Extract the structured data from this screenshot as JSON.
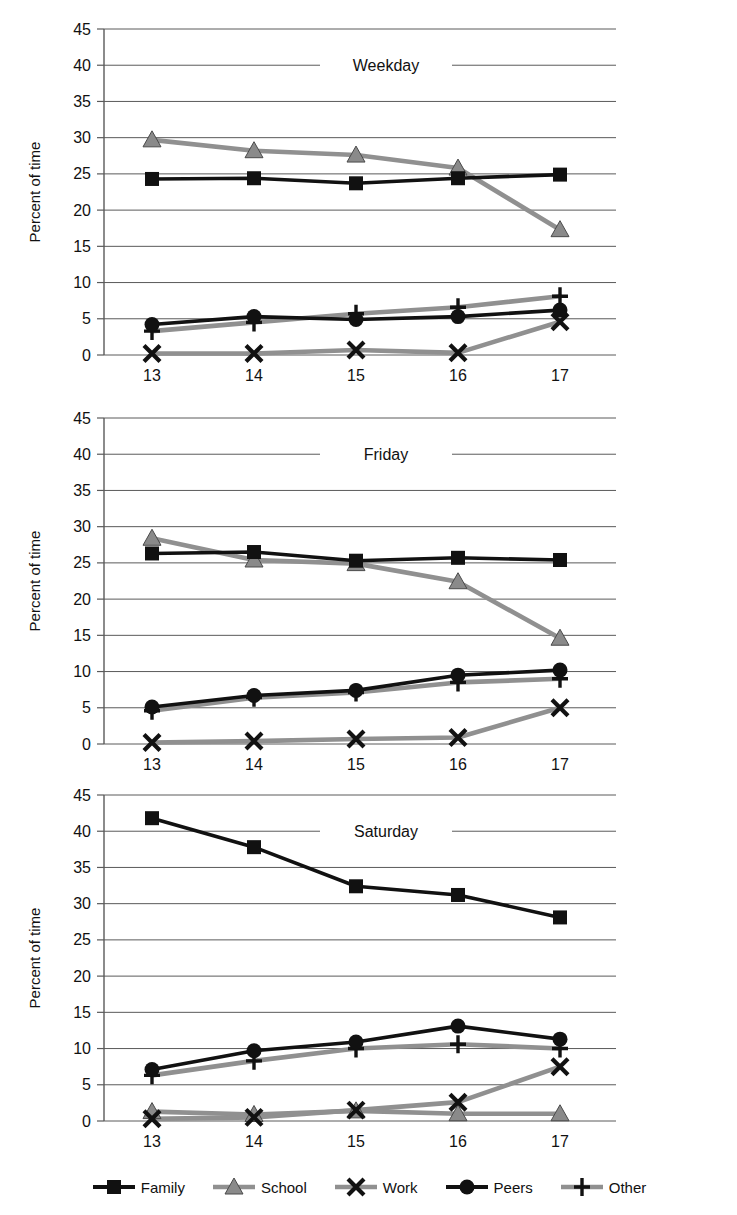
{
  "figure": {
    "y_axis_label": "Percent of time",
    "x_axis_label": "Age",
    "y_ticks": [
      "0",
      "5",
      "10",
      "15",
      "20",
      "25",
      "30",
      "35",
      "40",
      "45"
    ],
    "x_ticks": [
      "13",
      "14",
      "15",
      "16",
      "17"
    ]
  },
  "legend": {
    "position": "bottom",
    "items": [
      {
        "label": "Family",
        "marker": "square-marker",
        "color": "#111111"
      },
      {
        "label": "School",
        "marker": "triangle-marker",
        "color": "#808080"
      },
      {
        "label": "Work",
        "marker": "x-marker",
        "color": "#808080"
      },
      {
        "label": "Peers",
        "marker": "circle-marker",
        "color": "#111111"
      },
      {
        "label": "Other",
        "marker": "plus-marker",
        "color": "#808080"
      }
    ]
  },
  "colors": {
    "black_series": "#111111",
    "gray_series": "#909090",
    "gridline": "#5a5a5a",
    "background": "#ffffff"
  },
  "chart_data": [
    {
      "type": "line",
      "title": "Weekday",
      "xlabel": "Age",
      "ylabel": "Percent of time",
      "categories": [
        "13",
        "14",
        "15",
        "16",
        "17"
      ],
      "ylim": [
        0,
        45
      ],
      "ytick_step": 5,
      "grid": true,
      "legend_position": "bottom-shared",
      "series": [
        {
          "name": "Family",
          "marker": "square",
          "color": "#111111",
          "values": [
            24.3,
            24.4,
            23.7,
            24.4,
            24.9
          ]
        },
        {
          "name": "School",
          "marker": "triangle",
          "color": "#909090",
          "values": [
            29.7,
            28.2,
            27.6,
            25.8,
            17.3
          ]
        },
        {
          "name": "Work",
          "marker": "x",
          "color": "#909090",
          "values": [
            0.2,
            0.2,
            0.7,
            0.3,
            4.6
          ]
        },
        {
          "name": "Peers",
          "marker": "circle",
          "color": "#111111",
          "values": [
            4.2,
            5.3,
            4.9,
            5.3,
            6.2
          ]
        },
        {
          "name": "Other",
          "marker": "plus",
          "color": "#909090",
          "values": [
            3.3,
            4.5,
            5.7,
            6.6,
            8.1
          ]
        }
      ]
    },
    {
      "type": "line",
      "title": "Friday",
      "xlabel": "Age",
      "ylabel": "Percent of time",
      "categories": [
        "13",
        "14",
        "15",
        "16",
        "17"
      ],
      "ylim": [
        0,
        45
      ],
      "ytick_step": 5,
      "grid": true,
      "legend_position": "bottom-shared",
      "series": [
        {
          "name": "Family",
          "marker": "square",
          "color": "#111111",
          "values": [
            26.3,
            26.5,
            25.3,
            25.7,
            25.4
          ]
        },
        {
          "name": "School",
          "marker": "triangle",
          "color": "#909090",
          "values": [
            28.4,
            25.4,
            24.9,
            22.4,
            14.6
          ]
        },
        {
          "name": "Work",
          "marker": "x",
          "color": "#909090",
          "values": [
            0.2,
            0.4,
            0.7,
            0.9,
            5.0
          ]
        },
        {
          "name": "Peers",
          "marker": "circle",
          "color": "#111111",
          "values": [
            5.1,
            6.7,
            7.4,
            9.5,
            10.2
          ]
        },
        {
          "name": "Other",
          "marker": "plus",
          "color": "#909090",
          "values": [
            4.6,
            6.4,
            7.1,
            8.5,
            9.0
          ]
        }
      ]
    },
    {
      "type": "line",
      "title": "Saturday",
      "xlabel": "Age",
      "ylabel": "Percent of time",
      "categories": [
        "13",
        "14",
        "15",
        "16",
        "17"
      ],
      "ylim": [
        0,
        45
      ],
      "ytick_step": 5,
      "grid": true,
      "legend_position": "bottom-shared",
      "series": [
        {
          "name": "Family",
          "marker": "square",
          "color": "#111111",
          "values": [
            41.8,
            37.8,
            32.4,
            31.2,
            28.1
          ]
        },
        {
          "name": "School",
          "marker": "triangle",
          "color": "#909090",
          "values": [
            1.3,
            0.9,
            1.4,
            1.0,
            1.0
          ]
        },
        {
          "name": "Work",
          "marker": "x",
          "color": "#909090",
          "values": [
            0.3,
            0.5,
            1.5,
            2.6,
            7.5
          ]
        },
        {
          "name": "Peers",
          "marker": "circle",
          "color": "#111111",
          "values": [
            7.1,
            9.7,
            10.9,
            13.1,
            11.3
          ]
        },
        {
          "name": "Other",
          "marker": "plus",
          "color": "#909090",
          "values": [
            6.3,
            8.3,
            10.0,
            10.6,
            10.0
          ]
        }
      ]
    }
  ]
}
